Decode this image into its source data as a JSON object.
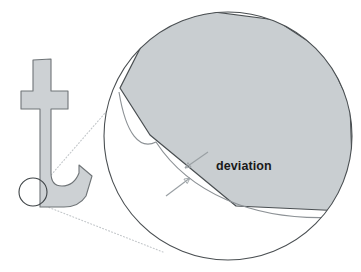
{
  "figure": {
    "background_color": "#ffffff",
    "width": 361,
    "height": 272
  },
  "annotations": {
    "deviation_label": "deviation"
  },
  "colors": {
    "shape_fill": "#cdd1d4",
    "shape_stroke": "#6f7477",
    "magnified_fill": "#c9ced1",
    "magnified_stroke": "#4a4f52",
    "circle_stroke": "#4a4f52",
    "small_circle_stroke": "#3d4245",
    "leader_line": "#c3c7ca",
    "arrow_color": "#9aa0a4",
    "text_color": "#1a1a1a"
  },
  "glyph": {
    "name": "letter-t",
    "path": "M 33,60 L 51,59 L 51,91 L 68,91 L 68,109 L 51,109 L 51,173 Q 51,186 62,186 Q 74,186 79,173 L 79,165 L 92,176 L 86,196 Q 79,207 64,207 L 40,207 L 40,109 L 21,109 L 21,91 L 33,91 Z"
  },
  "small_detail_circle": {
    "cx": 33,
    "cy": 192,
    "r": 14
  },
  "magnifier_circle": {
    "cx": 228,
    "cy": 136,
    "r": 124
  },
  "leader_lines": [
    {
      "name": "upper-leader",
      "x1": 45,
      "y1": 182,
      "x2": 139,
      "y2": 74
    },
    {
      "name": "lower-leader",
      "x1": 40,
      "y1": 204,
      "x2": 163,
      "y2": 252
    }
  ],
  "magnified_geometry": {
    "polygon_vertices": "120,88 152,25 214,12 276,20 326,53 350,104 352,160 344,211 236,206 150,135",
    "smooth_curve": "M 119,92 C 126,135 140,150 156,142 C 186,188 250,226 352,216",
    "description": "Faceted polygon approximation versus true smooth outline curve"
  },
  "deviation_marker": {
    "label": "deviation",
    "label_x": 216,
    "label_y": 170,
    "arrow_upper": {
      "x1": 208,
      "y1": 152,
      "x2": 185,
      "y2": 168
    },
    "arrow_lower": {
      "x1": 166,
      "y1": 196,
      "x2": 190,
      "y2": 178
    }
  }
}
